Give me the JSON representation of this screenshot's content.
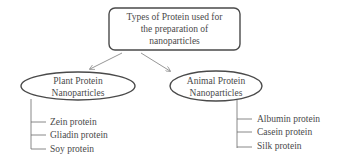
{
  "diagram": {
    "root": {
      "lines": [
        "Types of Protein used for",
        "the preparation of",
        "nanoparticles"
      ]
    },
    "categories": [
      {
        "lines": [
          "Plant Protein",
          "Nanoparticles"
        ],
        "items": [
          "Zein protein",
          "Gliadin protein",
          "Soy protein"
        ]
      },
      {
        "lines": [
          "Animal Protein",
          "Nanoparticles"
        ],
        "items": [
          "Albumin protein",
          "Casein protein",
          "Silk protein"
        ]
      }
    ]
  },
  "colors": {
    "stroke": "#4a4a4a",
    "arrow": "#8a8a8a",
    "text": "#4a4a4a"
  }
}
